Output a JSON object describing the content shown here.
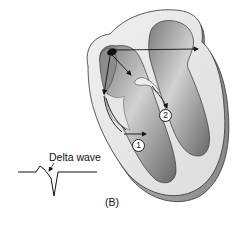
{
  "figure": {
    "panel_label": "(B)",
    "ecg": {
      "label": "Delta wave"
    },
    "markers": [
      {
        "id": "1",
        "label": "1"
      },
      {
        "id": "2",
        "label": "2"
      }
    ],
    "colors": {
      "chamber_dark": "#6e6e6e",
      "chamber_light": "#c9c9c9",
      "wall": "#e6e6e6",
      "wall_shadow": "#9a9a9a",
      "outline": "#333333",
      "arrow": "#111111",
      "node": "#111111"
    }
  }
}
